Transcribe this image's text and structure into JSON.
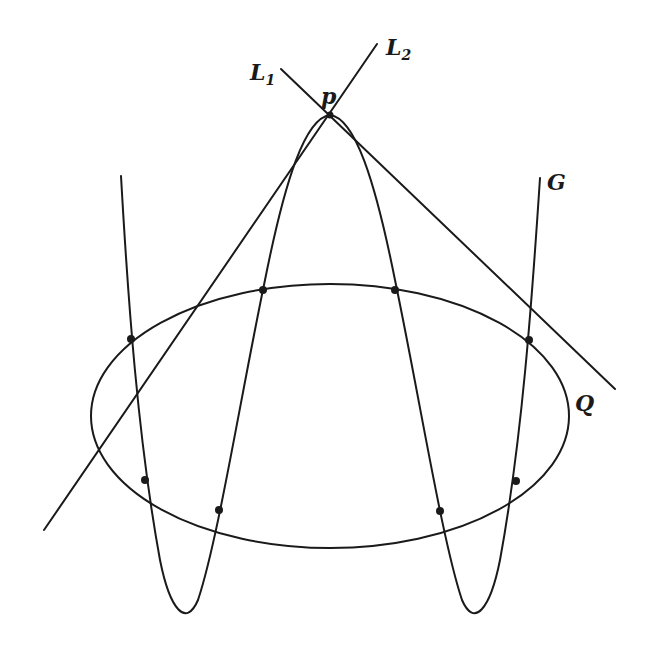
{
  "figure": {
    "labels": {
      "L1": {
        "main": "L",
        "sub": "1"
      },
      "L2": {
        "main": "L",
        "sub": "2"
      },
      "p": "p",
      "G": "G",
      "Q": "Q"
    },
    "colors": {
      "ink": "#1a1a1a",
      "background": "#ffffff"
    },
    "elements": {
      "conic_Q": {
        "type": "ellipse",
        "cx": 330,
        "cy": 416,
        "rx": 239,
        "ry": 132
      },
      "curve_G": {
        "type": "M-shaped curve",
        "peak": [
          330,
          115
        ],
        "troughs": [
          [
            179,
            617
          ],
          [
            480,
            617
          ]
        ],
        "ends": [
          [
            121,
            176
          ],
          [
            540,
            178
          ]
        ]
      },
      "line_L1": {
        "from": [
          281,
          69
        ],
        "to": [
          615,
          389
        ]
      },
      "line_L2": {
        "from": [
          377,
          44
        ],
        "to": [
          44,
          530
        ]
      },
      "intersection_points": [
        [
          131,
          339
        ],
        [
          263,
          290
        ],
        [
          395,
          290
        ],
        [
          529,
          340
        ],
        [
          145,
          480
        ],
        [
          219,
          510
        ],
        [
          440,
          511
        ],
        [
          516,
          481
        ]
      ]
    }
  }
}
